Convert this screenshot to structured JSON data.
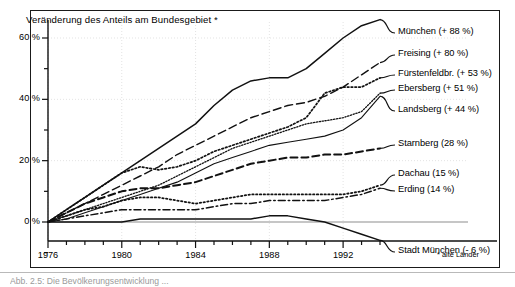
{
  "chart_data": {
    "type": "line",
    "title": "Veränderung des Anteils am Bundesgebiet *",
    "xlabel": "",
    "ylabel": "",
    "xlim": [
      1976,
      1994
    ],
    "ylim": [
      -10,
      68
    ],
    "grid": true,
    "legend_position": "right-of-plot, inline at series end",
    "footnote": "* alte Länder",
    "y_ticks_major": [
      "0 %",
      "20 %",
      "40 %",
      "60 %"
    ],
    "y_tick_values": [
      0,
      20,
      40,
      60
    ],
    "y_minor_step": 10,
    "x_ticks_major": [
      "1976",
      "1980",
      "1984",
      "1988",
      "1992"
    ],
    "x_tick_values": [
      1976,
      1980,
      1984,
      1988,
      1992
    ],
    "x_minor_step": 1,
    "x": [
      1976,
      1977,
      1978,
      1979,
      1980,
      1981,
      1982,
      1983,
      1984,
      1985,
      1986,
      1987,
      1988,
      1989,
      1990,
      1991,
      1992,
      1993,
      1994
    ],
    "series": [
      {
        "name": "München",
        "label": "München (+ 88 %)",
        "end_value_pct": 88,
        "style": "solid",
        "values": [
          0,
          4,
          8,
          12,
          16,
          20,
          24,
          28,
          32,
          38,
          43,
          46,
          47,
          47,
          50,
          55,
          60,
          64,
          66
        ]
      },
      {
        "name": "Freising",
        "label": "Freising (+ 80 %)",
        "end_value_pct": 80,
        "style": "long-dash",
        "values": [
          0,
          3,
          6,
          9,
          12,
          15,
          18,
          22,
          25,
          28,
          31,
          34,
          36,
          38,
          39,
          41,
          44,
          48,
          52
        ]
      },
      {
        "name": "Fürstenfeldbr.",
        "label": "Fürstenfeldbr. (+ 53 %)",
        "end_value_pct": 53,
        "style": "dotted",
        "values": [
          0,
          4,
          8,
          12,
          16,
          18,
          17,
          18,
          20,
          23,
          25,
          27,
          29,
          31,
          34,
          42,
          44,
          44,
          47
        ]
      },
      {
        "name": "Ebersberg",
        "label": "Ebersberg (+ 51 %)",
        "end_value_pct": 51,
        "style": "dense-dot",
        "values": [
          0,
          2,
          4,
          6,
          8,
          10,
          12,
          15,
          18,
          21,
          24,
          26,
          28,
          30,
          32,
          33,
          34,
          36,
          42
        ]
      },
      {
        "name": "Landsberg",
        "label": "Landsberg (+ 44 %)",
        "end_value_pct": 44,
        "style": "solid-thin",
        "values": [
          0,
          1,
          3,
          5,
          7,
          9,
          11,
          13,
          16,
          19,
          21,
          23,
          25,
          26,
          27,
          28,
          30,
          34,
          41
        ]
      },
      {
        "name": "Starnberg",
        "label": "Starnberg (28 %)",
        "end_value_pct": 28,
        "style": "dash",
        "values": [
          0,
          3,
          6,
          8,
          10,
          11,
          11,
          12,
          13,
          15,
          17,
          19,
          20,
          21,
          21,
          22,
          22,
          23,
          24
        ]
      },
      {
        "name": "Dachau",
        "label": "Dachau (15 %)",
        "end_value_pct": 15,
        "style": "fine-dot",
        "values": [
          0,
          2,
          4,
          5,
          7,
          8,
          8,
          7,
          6,
          7,
          8,
          9,
          9,
          9,
          9,
          9,
          9,
          10,
          12
        ]
      },
      {
        "name": "Erding",
        "label": "Erding (14 %)",
        "end_value_pct": 14,
        "style": "dash-dot",
        "values": [
          0,
          1,
          2,
          3,
          4,
          4,
          4,
          4,
          4,
          5,
          6,
          6,
          7,
          7,
          7,
          7,
          8,
          9,
          11
        ]
      },
      {
        "name": "Stadt München",
        "label": "Stadt München (- 6 %)",
        "end_value_pct": -6,
        "style": "solid",
        "values": [
          0,
          0,
          0,
          0,
          0,
          1,
          1,
          1,
          1,
          1,
          1,
          1,
          2,
          2,
          1,
          0,
          -2,
          -4,
          -6
        ]
      }
    ]
  },
  "caption": {
    "text": "Abb. 2.5: Die Bevölkerungsentwicklung ..."
  }
}
